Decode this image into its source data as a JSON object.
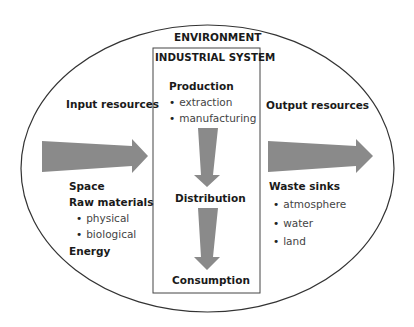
{
  "environment_label": "ENVIRONMENT",
  "industrial_system": {
    "title": "INDUSTRIAL SYSTEM",
    "production": {
      "label": "Production",
      "items": [
        "extraction",
        "manufacturing"
      ]
    },
    "distribution": "Distribution",
    "consumption": "Consumption"
  },
  "input": {
    "label": "Input resources",
    "space": "Space",
    "raw_materials": {
      "label": "Raw materials",
      "items": [
        "physical",
        "biological"
      ]
    },
    "energy": "Energy"
  },
  "output": {
    "label": "Output resources",
    "waste_sinks": {
      "label": "Waste sinks",
      "items": [
        "atmosphere",
        "water",
        "land"
      ]
    }
  },
  "colors": {
    "arrow": "#8a8a8a",
    "outline": "#333333",
    "text": "#1a1a1a"
  }
}
